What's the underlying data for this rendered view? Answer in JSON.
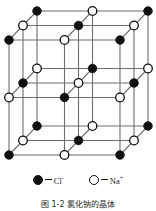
{
  "figure": {
    "title_alt": "NaCl crystal lattice",
    "projection": "oblique",
    "colors": {
      "grid_line": "#6e6e6e",
      "anion_fill": "#101010",
      "cation_fill": "#ffffff",
      "node_stroke": "#101010",
      "background": "#ffffff"
    }
  },
  "chart_data": {
    "type": "diagram",
    "grid": {
      "nx": 3,
      "ny": 3,
      "nz": 3,
      "cell_x": 55.5,
      "cell_y": 57.5,
      "depth_dx": 14.0,
      "depth_dy": -14.5,
      "origin_x": 9,
      "origin_y": 155
    },
    "ion_rule": "parity of (i+j+k): even = Cl-, odd = Na+",
    "ions": [
      {
        "symbol": "Cl",
        "charge": "-",
        "marker": "filled-circle",
        "color": "#101010"
      },
      {
        "symbol": "Na",
        "charge": "+",
        "marker": "open-circle",
        "color": "#ffffff"
      }
    ]
  },
  "legend": {
    "entries": [
      {
        "marker": "filled-circle",
        "dash": "—",
        "label": "Cl",
        "charge": "-",
        "name": "chloride-ion"
      },
      {
        "marker": "open-circle",
        "dash": "—",
        "label": "Na",
        "charge": "+",
        "name": "sodium-ion"
      }
    ]
  },
  "caption": {
    "text": "图 1-2  氯化钠的晶体"
  }
}
